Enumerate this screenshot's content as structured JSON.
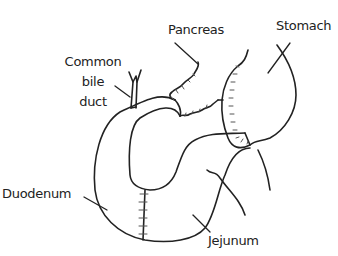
{
  "figure": {
    "type": "anatomical-diagram",
    "colors": {
      "line": "#222222",
      "suture": "#555555",
      "background": "#ffffff"
    }
  },
  "labels": {
    "pancreas": "Pancreas",
    "stomach": "Stomach",
    "common_bile_duct_line1": "Common",
    "common_bile_duct_line2": "bile",
    "common_bile_duct_line3": "duct",
    "duodenum": "Duodenum",
    "jejunum": "Jejunum"
  }
}
